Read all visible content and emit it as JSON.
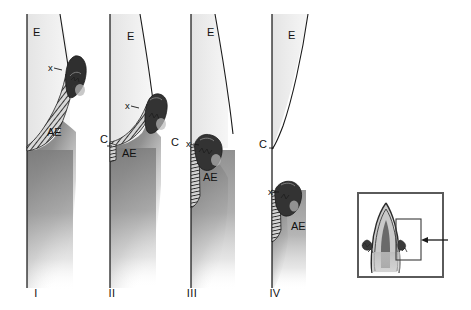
{
  "figure": {
    "background_color": "#ffffff",
    "line_color": "#1a1a1a",
    "enamel_fill": "#ececec",
    "dentin_fill": "#8c8c8c",
    "hatch_fill": "#3a3a3a",
    "inset_border_color": "#5a5a5a"
  },
  "legend_keys": {
    "E": "Enamel",
    "AE": "Attachment epithelium",
    "C": "Cementoenamel junction",
    "x": "Apical termination of attachment epithelium"
  },
  "panels": [
    {
      "id": "panel-1",
      "numeral": "I",
      "numeral_x": 36,
      "numeral_y": 294,
      "labels": [
        {
          "name": "enamel-label",
          "text": "E",
          "x": 33,
          "y": 33,
          "size": "lbl"
        },
        {
          "name": "x-marker-label",
          "text": "x",
          "x": 48,
          "y": 68,
          "size": "lbl-small"
        },
        {
          "name": "attachment-epithelium-label",
          "text": "AE",
          "x": 47,
          "y": 133,
          "size": "lbl"
        }
      ]
    },
    {
      "id": "panel-2",
      "numeral": "II",
      "numeral_x": 112,
      "numeral_y": 294,
      "labels": [
        {
          "name": "enamel-label",
          "text": "E",
          "x": 127,
          "y": 37,
          "size": "lbl"
        },
        {
          "name": "x-marker-label",
          "text": "x",
          "x": 125,
          "y": 106,
          "size": "lbl-small"
        },
        {
          "name": "cej-label",
          "text": "C",
          "x": 100,
          "y": 140,
          "size": "lbl"
        },
        {
          "name": "attachment-epithelium-label",
          "text": "AE",
          "x": 122,
          "y": 154,
          "size": "lbl"
        }
      ]
    },
    {
      "id": "panel-3",
      "numeral": "III",
      "numeral_x": 192,
      "numeral_y": 294,
      "labels": [
        {
          "name": "enamel-label",
          "text": "E",
          "x": 207,
          "y": 33,
          "size": "lbl"
        },
        {
          "name": "cej-label",
          "text": "C",
          "x": 171,
          "y": 143,
          "size": "lbl"
        },
        {
          "name": "x-marker-label",
          "text": "x",
          "x": 186,
          "y": 144,
          "size": "lbl-small"
        },
        {
          "name": "attachment-epithelium-label",
          "text": "AE",
          "x": 203,
          "y": 178,
          "size": "lbl"
        }
      ]
    },
    {
      "id": "panel-4",
      "numeral": "IV",
      "numeral_x": 275,
      "numeral_y": 294,
      "labels": [
        {
          "name": "enamel-label",
          "text": "E",
          "x": 288,
          "y": 36,
          "size": "lbl"
        },
        {
          "name": "cej-label",
          "text": "C",
          "x": 259,
          "y": 145,
          "size": "lbl"
        },
        {
          "name": "x-marker-label",
          "text": "x",
          "x": 268,
          "y": 192,
          "size": "lbl-small"
        },
        {
          "name": "attachment-epithelium-label",
          "text": "AE",
          "x": 291,
          "y": 227,
          "size": "lbl"
        }
      ]
    }
  ],
  "inset": {
    "name": "tooth-overview-inset",
    "box": {
      "x": 358,
      "y": 193,
      "width": 85,
      "height": 84
    },
    "has_callout_rect": true,
    "callout_rect": {
      "x": 408,
      "y": 220,
      "width": 25,
      "height": 40
    },
    "has_arrow": true,
    "arrow_label": ""
  }
}
